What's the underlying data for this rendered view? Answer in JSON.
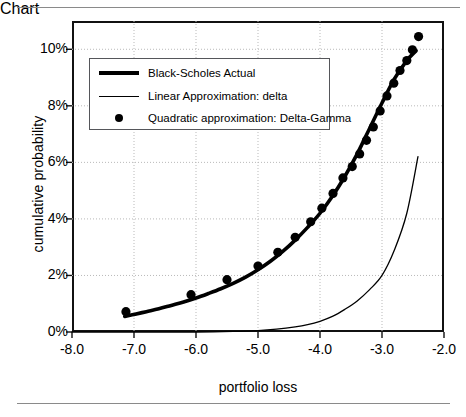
{
  "chart_data": {
    "type": "line",
    "title": "",
    "xlabel": "portfolio loss",
    "ylabel": "cumulative probability",
    "xlim": [
      -8.0,
      -2.0
    ],
    "ylim": [
      0,
      11.0
    ],
    "xticks": [
      "-8.0",
      "-7.0",
      "-6.0",
      "-5.0",
      "-4.0",
      "-3.0",
      "-2.0"
    ],
    "xtick_values": [
      -8.0,
      -7.0,
      -6.0,
      -5.0,
      -4.0,
      -3.0,
      -2.0
    ],
    "yticks": [
      "0%",
      "2%",
      "4%",
      "6%",
      "8%",
      "10%"
    ],
    "ytick_values": [
      0,
      2,
      4,
      6,
      8,
      10
    ],
    "grid": true,
    "legend_position": "upper-left-inside",
    "series": [
      {
        "name": "Black-Scholes Actual",
        "style": "thick-line",
        "color": "#000000",
        "x": [
          -7.15,
          -7.0,
          -6.8,
          -6.6,
          -6.4,
          -6.2,
          -6.0,
          -5.8,
          -5.6,
          -5.4,
          -5.2,
          -5.0,
          -4.8,
          -4.6,
          -4.4,
          -4.2,
          -4.0,
          -3.8,
          -3.6,
          -3.4,
          -3.2,
          -3.0,
          -2.8,
          -2.6,
          -2.45
        ],
        "y": [
          0.55,
          0.62,
          0.72,
          0.82,
          0.94,
          1.06,
          1.2,
          1.36,
          1.53,
          1.72,
          1.94,
          2.2,
          2.5,
          2.85,
          3.25,
          3.7,
          4.2,
          4.8,
          5.5,
          6.3,
          7.2,
          8.1,
          8.95,
          9.6,
          9.95
        ]
      },
      {
        "name": "Linear Approximation: delta",
        "style": "thin-line",
        "color": "#000000",
        "x": [
          -8.0,
          -7.0,
          -6.0,
          -5.4,
          -5.0,
          -4.7,
          -4.4,
          -4.2,
          -4.0,
          -3.8,
          -3.6,
          -3.4,
          -3.2,
          -3.0,
          -2.8,
          -2.6,
          -2.42
        ],
        "y": [
          0.0,
          0.0,
          0.0,
          0.02,
          0.05,
          0.1,
          0.18,
          0.26,
          0.38,
          0.55,
          0.8,
          1.1,
          1.5,
          2.0,
          2.9,
          4.2,
          6.2
        ]
      },
      {
        "name": "Quadratic approximation: Delta-Gamma",
        "style": "dots",
        "color": "#000000",
        "x": [
          -7.13,
          -6.08,
          -5.5,
          -5.0,
          -4.68,
          -4.4,
          -4.15,
          -3.97,
          -3.79,
          -3.63,
          -3.48,
          -3.36,
          -3.25,
          -3.14,
          -3.03,
          -2.92,
          -2.81,
          -2.71,
          -2.6,
          -2.51,
          -2.41
        ],
        "y": [
          0.72,
          1.32,
          1.85,
          2.33,
          2.82,
          3.35,
          3.9,
          4.38,
          4.9,
          5.45,
          5.85,
          6.3,
          6.78,
          7.25,
          7.82,
          8.35,
          8.8,
          9.25,
          9.6,
          9.98,
          10.45
        ]
      }
    ]
  },
  "legend": {
    "items": [
      {
        "label": "Black-Scholes Actual",
        "key": "thick-line-key"
      },
      {
        "label": "Linear Approximation: delta",
        "key": "thin-line-key"
      },
      {
        "label": "Quadratic approximation: Delta-Gamma",
        "key": "dot-marker-key"
      }
    ]
  },
  "axes": {
    "ylabel": "cumulative probability",
    "xlabel": "portfolio loss"
  }
}
